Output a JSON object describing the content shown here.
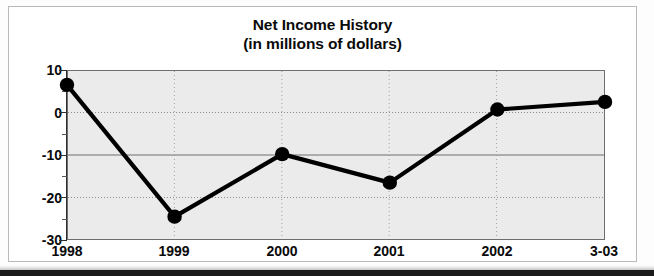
{
  "chart_data": {
    "type": "line",
    "title": "Net Income History",
    "subtitle": "(in millions of dollars)",
    "xlabel": "",
    "ylabel": "",
    "categories": [
      "1998",
      "1999",
      "2000",
      "2001",
      "2002",
      "3-03"
    ],
    "values": [
      6.5,
      -24.5,
      -9.8,
      -16.5,
      0.7,
      2.5
    ],
    "series": [
      {
        "name": "Net Income",
        "values": [
          6.5,
          -24.5,
          -9.8,
          -16.5,
          0.7,
          2.5
        ]
      }
    ],
    "ylim": [
      -30,
      10
    ],
    "ytick_labels": [
      "10",
      "0",
      "-10",
      "-20",
      "-30"
    ],
    "ytick_values": [
      10,
      0,
      -10,
      -20,
      -30
    ],
    "yminor_values": [
      5,
      -5,
      -15,
      -25
    ],
    "grid": true,
    "grid_style": "dotted",
    "legend": "none",
    "marker": "filled-circle",
    "line_color": "#000000",
    "marker_color": "#000000",
    "plot_bg_color": "#ebebeb",
    "frame_color": "#b9b9b9",
    "axis_color": "#2e2e2e",
    "text_color": "#0a0a0a"
  }
}
